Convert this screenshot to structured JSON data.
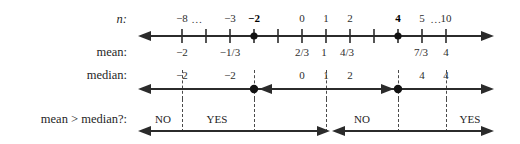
{
  "figure": {
    "kind": "number-line-diagram",
    "rows": [
      {
        "key": "n",
        "label": "n:",
        "italic_label": true
      },
      {
        "key": "mean",
        "label": "mean:",
        "italic_label": false
      },
      {
        "key": "median",
        "label": "median:",
        "italic_label": false
      },
      {
        "key": "comparison",
        "label": "mean > median?:",
        "italic_label": false
      }
    ]
  },
  "axis": {
    "left_arrow_x": 141,
    "right_arrow_x": 492,
    "tick_start_x": 182,
    "tick_spacing": 24,
    "tick_count": 12
  },
  "n_row": {
    "label": "n:",
    "ticks": [
      {
        "x": 182,
        "text": "−8",
        "bold": false
      },
      {
        "x": 206,
        "text": "",
        "bold": false
      },
      {
        "x": 230,
        "text": "−3",
        "bold": false
      },
      {
        "x": 254,
        "text": "−2",
        "bold": true
      },
      {
        "x": 278,
        "text": "",
        "bold": false
      },
      {
        "x": 302,
        "text": "0",
        "bold": false
      },
      {
        "x": 326,
        "text": "1",
        "bold": false
      },
      {
        "x": 350,
        "text": "2",
        "bold": false
      },
      {
        "x": 374,
        "text": "",
        "bold": false
      },
      {
        "x": 398,
        "text": "4",
        "bold": true
      },
      {
        "x": 422,
        "text": "5",
        "bold": false
      },
      {
        "x": 446,
        "text": "10",
        "bold": false
      }
    ],
    "ellipses": [
      {
        "x": 197,
        "text": "…"
      },
      {
        "x": 436,
        "text": "…"
      }
    ],
    "dots": [
      {
        "x": 254
      },
      {
        "x": 398
      }
    ]
  },
  "mean_row": {
    "label": "mean:",
    "values": [
      {
        "x": 182,
        "text": "−2"
      },
      {
        "x": 230,
        "text": "−1/3"
      },
      {
        "x": 302,
        "text": "2/3"
      },
      {
        "x": 324,
        "text": "1"
      },
      {
        "x": 347,
        "text": "4/3"
      },
      {
        "x": 421,
        "text": "7/3"
      },
      {
        "x": 446,
        "text": "4"
      }
    ]
  },
  "median_row": {
    "label": "median:",
    "values": [
      {
        "x": 182,
        "text": "−2"
      },
      {
        "x": 230,
        "text": "−2"
      },
      {
        "x": 302,
        "text": "0"
      },
      {
        "x": 326,
        "text": "1"
      },
      {
        "x": 350,
        "text": "2"
      },
      {
        "x": 422,
        "text": "4"
      },
      {
        "x": 446,
        "text": "4"
      }
    ],
    "dots": [
      {
        "x": 254
      },
      {
        "x": 398
      }
    ],
    "dashed_markers": [
      {
        "x": 182
      },
      {
        "x": 254
      },
      {
        "x": 326
      },
      {
        "x": 398
      },
      {
        "x": 446
      }
    ],
    "segments": [
      {
        "from": 141,
        "to": 258,
        "left_arrow": true,
        "right_arrow": false
      },
      {
        "from": 258,
        "to": 492,
        "left_arrow": true,
        "right_arrow": true
      }
    ],
    "inner_arrow_left_x": 262,
    "inner_arrow_right_x": 393
  },
  "comparison_row": {
    "label": "mean > median?:",
    "answers": [
      {
        "x": 163,
        "text": "NO"
      },
      {
        "x": 217,
        "text": "YES"
      },
      {
        "x": 362,
        "text": "NO"
      },
      {
        "x": 470,
        "text": "YES"
      }
    ],
    "dashed_markers": [
      {
        "x": 182
      },
      {
        "x": 254
      },
      {
        "x": 326
      },
      {
        "x": 398
      },
      {
        "x": 446
      }
    ],
    "segments": [
      {
        "from": 141,
        "to": 328,
        "left_arrow": true,
        "right_arrow": true
      },
      {
        "from": 330,
        "to": 492,
        "left_arrow": true,
        "right_arrow": true
      }
    ]
  },
  "colors": {
    "ink": "#1b1b1b",
    "line": "#2b2b2b",
    "dashed": "#4a4a4a",
    "background": "#ffffff"
  }
}
